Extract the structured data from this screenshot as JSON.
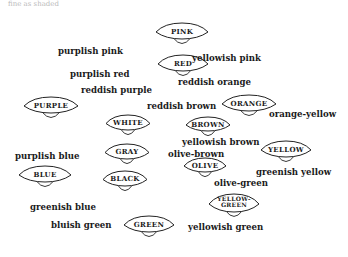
{
  "caption": "fine as shaded",
  "nodes": [
    {
      "id": "pink",
      "label": "PINK",
      "x": 155,
      "y": 22,
      "w": 54,
      "h": 18
    },
    {
      "id": "red",
      "label": "RED",
      "x": 157,
      "y": 54,
      "w": 52,
      "h": 18
    },
    {
      "id": "purple",
      "label": "PURPLE",
      "x": 23,
      "y": 96,
      "w": 56,
      "h": 18
    },
    {
      "id": "white",
      "label": "WHITE",
      "x": 105,
      "y": 114,
      "w": 46,
      "h": 17
    },
    {
      "id": "orange",
      "label": "ORANGE",
      "x": 221,
      "y": 94,
      "w": 56,
      "h": 18
    },
    {
      "id": "brown",
      "label": "BROWN",
      "x": 185,
      "y": 116,
      "w": 46,
      "h": 16
    },
    {
      "id": "gray",
      "label": "GRAY",
      "x": 104,
      "y": 143,
      "w": 46,
      "h": 17
    },
    {
      "id": "yellow",
      "label": "YELLOW",
      "x": 260,
      "y": 140,
      "w": 52,
      "h": 18
    },
    {
      "id": "blue",
      "label": "BLUE",
      "x": 18,
      "y": 165,
      "w": 54,
      "h": 18
    },
    {
      "id": "black",
      "label": "BLACK",
      "x": 102,
      "y": 170,
      "w": 46,
      "h": 17
    },
    {
      "id": "olive",
      "label": "OLIVE",
      "x": 183,
      "y": 157,
      "w": 44,
      "h": 16
    },
    {
      "id": "yellow-green",
      "label": "YELLOW-\nGREEN",
      "x": 208,
      "y": 193,
      "w": 52,
      "h": 20
    },
    {
      "id": "green",
      "label": "GREEN",
      "x": 123,
      "y": 215,
      "w": 52,
      "h": 18
    }
  ],
  "labels": [
    {
      "text": "purplish pink",
      "x": 58,
      "y": 47
    },
    {
      "text": "yellowish pink",
      "x": 192,
      "y": 54
    },
    {
      "text": "purplish red",
      "x": 70,
      "y": 70
    },
    {
      "text": "reddish orange",
      "x": 178,
      "y": 78
    },
    {
      "text": "reddish purple",
      "x": 81,
      "y": 86
    },
    {
      "text": "reddish brown",
      "x": 147,
      "y": 102
    },
    {
      "text": "orange-yellow",
      "x": 269,
      "y": 110
    },
    {
      "text": "yellowish brown",
      "x": 182,
      "y": 138
    },
    {
      "text": "olive-brown",
      "x": 168,
      "y": 150
    },
    {
      "text": "purplish blue",
      "x": 15,
      "y": 152
    },
    {
      "text": "greenish yellow",
      "x": 256,
      "y": 168
    },
    {
      "text": "olive-green",
      "x": 214,
      "y": 179
    },
    {
      "text": "greenish blue",
      "x": 30,
      "y": 203
    },
    {
      "text": "bluish green",
      "x": 51,
      "y": 221
    },
    {
      "text": "yellowish green",
      "x": 188,
      "y": 223
    }
  ]
}
